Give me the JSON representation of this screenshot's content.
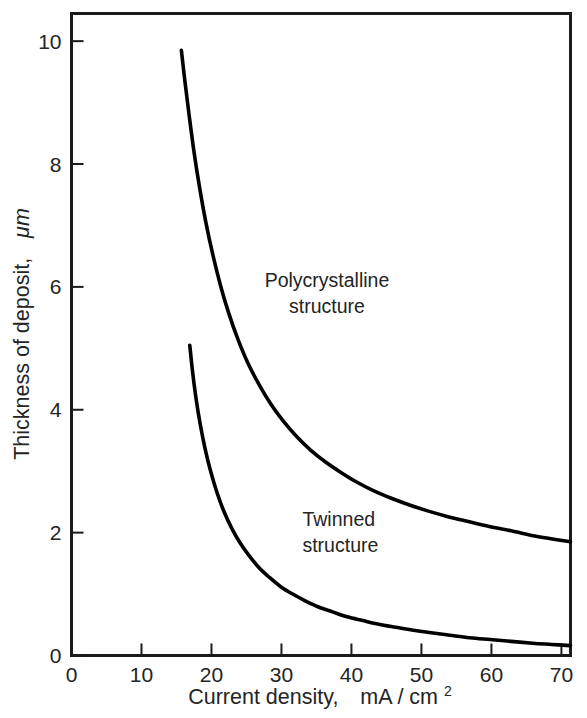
{
  "chart_data": {
    "type": "line",
    "title": "",
    "xlabel": "Current density,   mA / cm2",
    "xlabel_main": "Current density,",
    "xlabel_unit": "mA / cm",
    "xlabel_exponent": "2",
    "ylabel": "Thickness of deposit,  μm",
    "ylabel_main": "Thickness of deposit,",
    "ylabel_unit": "μm",
    "xlim": [
      0,
      71.3
    ],
    "ylim": [
      0,
      10.45
    ],
    "xticks": [
      0,
      10,
      20,
      30,
      40,
      50,
      60,
      70
    ],
    "xtick_labels": [
      "0",
      "10",
      "20",
      "30",
      "40",
      "50",
      "60",
      "70"
    ],
    "yticks": [
      0,
      2,
      4,
      6,
      8,
      10
    ],
    "ytick_labels": [
      "0",
      "2",
      "4",
      "6",
      "8",
      "10"
    ],
    "grid": false,
    "legend": "none",
    "frame": "box",
    "line_color": "#000000",
    "series": [
      {
        "name": "Polycrystalline / Twinned boundary (upper)",
        "x": [
          15.7,
          16.2,
          16.8,
          17.5,
          18.3,
          19.2,
          20.2,
          21.3,
          22.5,
          23.8,
          25.2,
          26.8,
          28.5,
          30.3,
          32.2,
          34.2,
          36.3,
          38.5,
          40.8,
          43.2,
          45.7,
          48.3,
          51.0,
          53.8,
          56.7,
          59.7,
          62.8,
          66.0,
          68.5,
          71.3
        ],
        "y": [
          9.85,
          9.35,
          8.8,
          8.2,
          7.62,
          7.05,
          6.52,
          6.02,
          5.56,
          5.14,
          4.76,
          4.41,
          4.09,
          3.81,
          3.56,
          3.34,
          3.15,
          2.98,
          2.82,
          2.68,
          2.56,
          2.45,
          2.35,
          2.26,
          2.18,
          2.1,
          2.03,
          1.95,
          1.9,
          1.85
        ]
      },
      {
        "name": "Twinned structure boundary (lower)",
        "x": [
          16.9,
          17.3,
          17.8,
          18.4,
          19.1,
          19.9,
          20.8,
          21.8,
          22.9,
          24.1,
          25.4,
          26.8,
          28.3,
          29.9,
          31.6,
          33.4,
          35.3,
          37.3,
          39.4,
          41.6,
          43.9,
          46.3,
          48.8,
          51.4,
          54.1,
          56.9,
          59.8,
          62.8,
          65.9,
          68.6,
          71.3
        ],
        "y": [
          5.05,
          4.62,
          4.18,
          3.76,
          3.36,
          2.99,
          2.65,
          2.34,
          2.07,
          1.83,
          1.62,
          1.43,
          1.27,
          1.12,
          1.0,
          0.89,
          0.79,
          0.71,
          0.63,
          0.57,
          0.51,
          0.46,
          0.41,
          0.37,
          0.33,
          0.29,
          0.26,
          0.23,
          0.2,
          0.18,
          0.16
        ]
      }
    ],
    "annotations": [
      {
        "name": "polycrystalline-region-label",
        "lines": [
          "Polycrystalline",
          "structure"
        ],
        "line1": "Polycrystalline",
        "line2": "structure",
        "x": 36.5,
        "y": 6.0
      },
      {
        "name": "twinned-region-label",
        "lines": [
          "Twinned",
          "structure"
        ],
        "line1": "Twinned",
        "line2": "structure",
        "x": 33.0,
        "y": 2.1
      }
    ]
  }
}
